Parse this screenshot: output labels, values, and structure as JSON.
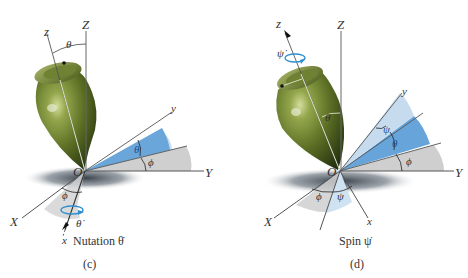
{
  "figure": {
    "panels": [
      {
        "id": "c",
        "caption": "(c)",
        "motion_label": "Nutation θ̇",
        "labels": {
          "Z": "Z",
          "z": "z",
          "theta_top": "θ",
          "O": "O",
          "y": "y",
          "Y": "Y",
          "theta_sector": "θ",
          "phi_sector": "ϕ",
          "X": "X",
          "x": "x",
          "phi_bottom": "ϕ",
          "theta_dot": "θ̇"
        }
      },
      {
        "id": "d",
        "caption": "(d)",
        "motion_label": "Spin ψ̇",
        "labels": {
          "Z": "Z",
          "z": "z",
          "psi_dot": "ψ̇",
          "theta_body": "θ",
          "O": "O",
          "y": "y",
          "Y": "Y",
          "psi_sector": "ψ",
          "theta_sector": "θ",
          "phi_sector": "ϕ",
          "X": "X",
          "x": "x",
          "phi_bottom": "ϕ",
          "psi_bottom": "ψ"
        }
      }
    ],
    "colors": {
      "top_body": "#5d6e2a",
      "top_highlight": "#b9c77a",
      "blue_sector": "#5fa1d8",
      "light_blue_sector": "#bcd9ef",
      "gray_sector": "#cfcfcf",
      "shadow": "#3c4650",
      "rotation_arrow": "#2f8fd0"
    }
  }
}
